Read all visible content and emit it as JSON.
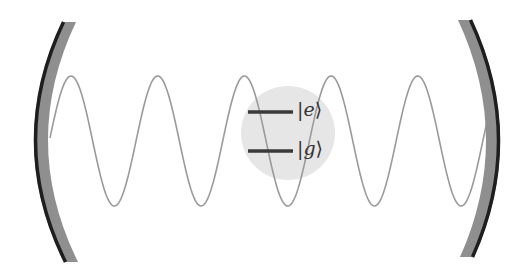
{
  "diagram": {
    "title": "",
    "type": "optical cavity with two-level atom",
    "colors": {
      "background": "#ffffff",
      "mirror_fill": "#8f8f8f",
      "mirror_edge": "#1e1e1e",
      "wave": "#9a9a9a",
      "atom_circle": "#e6e6e6",
      "level_line": "#3a3a3a",
      "label_text": "#333333"
    },
    "mirrors": {
      "left": {
        "top": [
          62,
          22
        ],
        "bottom": [
          64,
          262
        ],
        "apex_x": 34
      },
      "right": {
        "top": [
          472,
          20
        ],
        "bottom": [
          474,
          257
        ],
        "apex_x": 500
      }
    },
    "wave": {
      "x_start": 50,
      "x_end": 487,
      "center_y": 141,
      "amplitude": 65,
      "period": 86.7,
      "first_peak_x": 71
    },
    "atom": {
      "center": [
        288,
        133
      ],
      "radius": 47,
      "levels": [
        {
          "name": "excited",
          "label_prefix": "|",
          "label_symbol": "e",
          "label_suffix": "⟩",
          "y": 112,
          "x1": 248,
          "x2": 293
        },
        {
          "name": "ground",
          "label_prefix": "|",
          "label_symbol": "g",
          "label_suffix": "⟩",
          "y": 151,
          "x1": 248,
          "x2": 293
        }
      ]
    }
  }
}
